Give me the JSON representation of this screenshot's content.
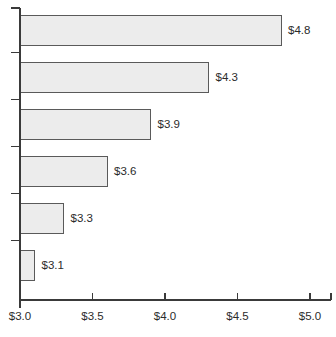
{
  "chart_data": {
    "type": "bar",
    "orientation": "horizontal",
    "title": "",
    "subtitle": "",
    "xlabel": "",
    "ylabel": "",
    "categories": [
      "",
      "",
      "",
      "",
      "",
      ""
    ],
    "values": [
      4.8,
      4.3,
      3.9,
      3.6,
      3.3,
      3.1
    ],
    "data_labels": [
      "$4.8",
      "$4.3",
      "$3.9",
      "$3.6",
      "$3.3",
      "$3.1"
    ],
    "xlim": [
      3.0,
      5.0
    ],
    "x_ticks": [
      3.0,
      3.5,
      4.0,
      4.5,
      5.0
    ],
    "x_tick_labels": [
      "$3.0",
      "$3.5",
      "$4.0",
      "$4.5",
      "$5.0"
    ],
    "y_ticks_count": 6,
    "grid": false,
    "legend": null,
    "legend_position": "none",
    "series": [
      {
        "name": "",
        "values": [
          4.8,
          4.3,
          3.9,
          3.6,
          3.3,
          3.1
        ]
      }
    ],
    "colors": {
      "bar_fill": "#ececec",
      "bar_stroke": "#5a5a5a",
      "axis": "#3a3a3a",
      "text": "#2b2b2b",
      "background": "#ffffff"
    }
  },
  "geometry": {
    "x_axis_y": 300,
    "y_axis_x": 20,
    "x_axis_right": 331,
    "y_axis_top": 8,
    "y_axis_bottom": 308,
    "px_per_unit": 145,
    "bar_height": 30,
    "bar_pitch": 47,
    "first_bar_top": 15,
    "tick_len_x": 7,
    "tick_len_y": 9,
    "label_gap": 7
  }
}
